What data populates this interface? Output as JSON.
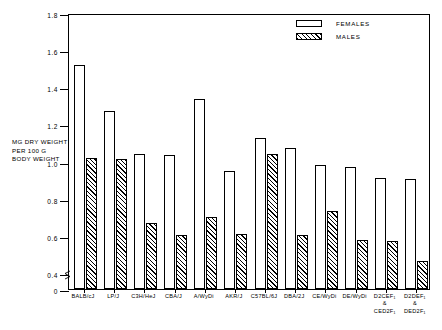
{
  "chart_data": {
    "type": "bar",
    "title": "",
    "subtitle": "",
    "xlabel": "",
    "ylabel": "MG DRY WEIGHT PER 100 G BODY WEIGHT",
    "ylabel_lines": [
      "MG DRY WEIGHT",
      "PER 100 G",
      "BODY WEIGHT"
    ],
    "ylim": [
      0,
      1.8
    ],
    "y_axis_break": true,
    "y_break_range": [
      0.0,
      0.4
    ],
    "yticks": [
      1.8,
      1.6,
      1.4,
      1.2,
      1.0,
      0.8,
      0.6,
      0.4,
      0
    ],
    "ytick_labels": [
      "1.8",
      "1.6",
      "1.4",
      "1.2",
      "1.0",
      "0.8",
      "0.6",
      "0.4",
      "0"
    ],
    "grid": false,
    "legend_position": "top-right",
    "categories": [
      "BALB/cJ",
      "LP/J",
      "C3H/HeJ",
      "CBA/J",
      "A/WyDi",
      "AKR/J",
      "C57BL/6J",
      "DBA/2J",
      "CE/WyDi",
      "DE/WyDi",
      "D2CEF1 & CED2F1",
      "D2DEF1 & DED2F1"
    ],
    "category_label_lines": [
      [
        "BALB/cJ"
      ],
      [
        "LP/J"
      ],
      [
        "C3H/HeJ"
      ],
      [
        "CBA/J"
      ],
      [
        "A/WyDi"
      ],
      [
        "AKR/J"
      ],
      [
        "C57BL/6J"
      ],
      [
        "DBA/2J"
      ],
      [
        "CE/WyDi"
      ],
      [
        "DE/WyDi"
      ],
      [
        "D2CEF₁",
        "&",
        "CED2F₁"
      ],
      [
        "D2DEF₁",
        "&",
        "DED2F₁"
      ]
    ],
    "series": [
      {
        "name": "FEMALES",
        "fill": "open",
        "color": "#ffffff",
        "values": [
          1.52,
          1.27,
          1.04,
          1.035,
          1.335,
          0.95,
          1.125,
          1.075,
          0.98,
          0.97,
          0.91,
          0.905
        ]
      },
      {
        "name": "MALES",
        "fill": "hatched",
        "color": "#000000",
        "values": [
          1.02,
          1.015,
          0.67,
          0.605,
          0.7,
          0.61,
          1.04,
          0.605,
          0.735,
          0.58,
          0.575,
          0.465
        ]
      }
    ]
  },
  "legend": {
    "entries": [
      {
        "label": "FEMALES",
        "swatch": "open-box"
      },
      {
        "label": "MALES",
        "swatch": "hatched-box"
      }
    ]
  }
}
